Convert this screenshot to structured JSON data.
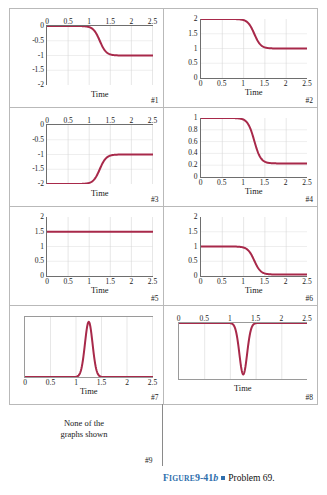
{
  "figure": {
    "caption_label": "FIGURE",
    "caption_number": "9-41",
    "caption_number_italic": "b",
    "caption_text": "Problem 69.",
    "accent_color": "#2f6fad",
    "curve_color": "#a8294a"
  },
  "axis": {
    "xlabel": "Time",
    "xticks": [
      "0",
      "0.5",
      "1",
      "1.5",
      "2",
      "2.5"
    ],
    "xlim": [
      0,
      2.5
    ]
  },
  "panels": [
    {
      "id": "#1",
      "xlabel": "Time",
      "xticks": [
        "0",
        "0.5",
        "1",
        "1.5",
        "2",
        "2.5"
      ],
      "xticks_position": "top",
      "yticks": [
        "0",
        "-0.5",
        "-1",
        "-1.5",
        "-2"
      ],
      "ylim": [
        -2,
        0
      ],
      "shape": "step-down",
      "start": 0,
      "end": -1,
      "center": 1.25
    },
    {
      "id": "#2",
      "xlabel": "Time",
      "xticks": [
        "0",
        "0.5",
        "1",
        "1.5",
        "2",
        "2.5"
      ],
      "xticks_position": "bottom",
      "yticks": [
        "2",
        "1.5",
        "1",
        "0.5",
        "0"
      ],
      "ylim": [
        0,
        2
      ],
      "shape": "step-down",
      "start": 2,
      "end": 1,
      "center": 1.25
    },
    {
      "id": "#3",
      "xlabel": "Time",
      "xticks": [
        "0",
        "0.5",
        "1",
        "1.5",
        "2",
        "2.5"
      ],
      "xticks_position": "top",
      "yticks": [
        "0",
        "-0.5",
        "-1",
        "-1.5",
        "-2"
      ],
      "ylim": [
        -2,
        0
      ],
      "shape": "step-up",
      "start": -2,
      "end": -1,
      "center": 1.25
    },
    {
      "id": "#4",
      "xlabel": "Time",
      "xticks": [
        "0",
        "0.5",
        "1",
        "1.5",
        "2",
        "2.5"
      ],
      "xticks_position": "bottom",
      "yticks": [
        "1",
        "0.8",
        "0.6",
        "0.4",
        "0.2",
        "0"
      ],
      "ylim": [
        0,
        1
      ],
      "shape": "step-down",
      "start": 1,
      "end": 0.23,
      "center": 1.25
    },
    {
      "id": "#5",
      "xlabel": "Time",
      "xticks": [
        "0",
        "0.5",
        "1",
        "1.5",
        "2",
        "2.5"
      ],
      "xticks_position": "bottom",
      "yticks": [
        "2",
        "1.5",
        "1",
        "0.5",
        "0"
      ],
      "ylim": [
        0,
        2
      ],
      "shape": "constant",
      "start": 1.5,
      "end": 1.5,
      "center": 1.25
    },
    {
      "id": "#6",
      "xlabel": "Time",
      "xticks": [
        "0",
        "0.5",
        "1",
        "1.5",
        "2",
        "2.5"
      ],
      "xticks_position": "bottom",
      "yticks": [
        "2",
        "1.5",
        "1",
        "0.5",
        "0"
      ],
      "ylim": [
        0,
        2
      ],
      "shape": "step-down",
      "start": 1,
      "end": 0.05,
      "center": 1.25
    },
    {
      "id": "#7",
      "xlabel": "Time",
      "xticks": [
        "0",
        "0.5",
        "1",
        "1.5",
        "2",
        "2.5"
      ],
      "xticks_position": "bottom",
      "yticks": [],
      "ylim": [
        0,
        1
      ],
      "shape": "peak-up",
      "start": 0,
      "end": 0,
      "center": 1.25
    },
    {
      "id": "#8",
      "xlabel": "Time",
      "xticks": [
        "0",
        "0.5",
        "1",
        "1.5",
        "2",
        "2.5"
      ],
      "xticks_position": "top",
      "yticks": [],
      "ylim": [
        -1,
        0
      ],
      "shape": "peak-down",
      "start": 0,
      "end": 0,
      "center": 1.25
    }
  ],
  "panel9": {
    "id": "#9",
    "line1": "None of the",
    "line2": "graphs shown"
  },
  "chart_data": [
    {
      "type": "line",
      "title": "#1",
      "xlabel": "Time",
      "ylabel": "",
      "xlim": [
        0,
        2.5
      ],
      "ylim": [
        -2,
        0
      ],
      "xticks": [
        0,
        0.5,
        1,
        1.5,
        2,
        2.5
      ],
      "yticks": [
        0,
        -0.5,
        -1,
        -1.5,
        -2
      ],
      "grid": true,
      "description": "Sigmoid step down from 0 to -1 centered near t = 1.25",
      "x": [
        0,
        0.25,
        0.5,
        0.75,
        1,
        1.1,
        1.2,
        1.25,
        1.3,
        1.4,
        1.5,
        1.75,
        2,
        2.25,
        2.5
      ],
      "values": [
        0,
        0,
        0,
        -0.01,
        -0.05,
        -0.13,
        -0.35,
        -0.5,
        -0.66,
        -0.88,
        -0.96,
        -1,
        -1,
        -1,
        -1
      ]
    },
    {
      "type": "line",
      "title": "#2",
      "xlabel": "Time",
      "ylabel": "",
      "xlim": [
        0,
        2.5
      ],
      "ylim": [
        0,
        2
      ],
      "xticks": [
        0,
        0.5,
        1,
        1.5,
        2,
        2.5
      ],
      "yticks": [
        0,
        0.5,
        1,
        1.5,
        2
      ],
      "grid": true,
      "description": "Sigmoid step down from 2 to 1 centered near t = 1.25",
      "x": [
        0,
        0.25,
        0.5,
        0.75,
        1,
        1.1,
        1.2,
        1.25,
        1.3,
        1.4,
        1.5,
        1.75,
        2,
        2.25,
        2.5
      ],
      "values": [
        2,
        2,
        2,
        1.99,
        1.95,
        1.87,
        1.65,
        1.5,
        1.34,
        1.12,
        1.04,
        1,
        1,
        1,
        1
      ]
    },
    {
      "type": "line",
      "title": "#3",
      "xlabel": "Time",
      "ylabel": "",
      "xlim": [
        0,
        2.5
      ],
      "ylim": [
        -2,
        0
      ],
      "xticks": [
        0,
        0.5,
        1,
        1.5,
        2,
        2.5
      ],
      "yticks": [
        0,
        -0.5,
        -1,
        -1.5,
        -2
      ],
      "grid": true,
      "description": "Sigmoid step up from -2 to -1 centered near t = 1.25",
      "x": [
        0,
        0.25,
        0.5,
        0.75,
        1,
        1.1,
        1.2,
        1.25,
        1.3,
        1.4,
        1.5,
        1.75,
        2,
        2.25,
        2.5
      ],
      "values": [
        -2,
        -2,
        -2,
        -1.99,
        -1.95,
        -1.87,
        -1.65,
        -1.5,
        -1.34,
        -1.12,
        -1.04,
        -1,
        -1,
        -1,
        -1
      ]
    },
    {
      "type": "line",
      "title": "#4",
      "xlabel": "Time",
      "ylabel": "",
      "xlim": [
        0,
        2.5
      ],
      "ylim": [
        0,
        1
      ],
      "xticks": [
        0,
        0.5,
        1,
        1.5,
        2,
        2.5
      ],
      "yticks": [
        0,
        0.2,
        0.4,
        0.6,
        0.8,
        1
      ],
      "grid": true,
      "description": "Sigmoid step down from 1 to about 0.23 centered near t = 1.25",
      "x": [
        0,
        0.25,
        0.5,
        0.75,
        1,
        1.1,
        1.2,
        1.25,
        1.3,
        1.4,
        1.5,
        1.75,
        2,
        2.25,
        2.5
      ],
      "values": [
        1,
        1,
        1,
        0.99,
        0.97,
        0.91,
        0.75,
        0.62,
        0.49,
        0.32,
        0.26,
        0.23,
        0.23,
        0.23,
        0.23
      ]
    },
    {
      "type": "line",
      "title": "#5",
      "xlabel": "Time",
      "ylabel": "",
      "xlim": [
        0,
        2.5
      ],
      "ylim": [
        0,
        2
      ],
      "xticks": [
        0,
        0.5,
        1,
        1.5,
        2,
        2.5
      ],
      "yticks": [
        0,
        0.5,
        1,
        1.5,
        2
      ],
      "grid": true,
      "description": "Constant horizontal line at 1.5",
      "x": [
        0,
        0.5,
        1,
        1.5,
        2,
        2.5
      ],
      "values": [
        1.5,
        1.5,
        1.5,
        1.5,
        1.5,
        1.5
      ]
    },
    {
      "type": "line",
      "title": "#6",
      "xlabel": "Time",
      "ylabel": "",
      "xlim": [
        0,
        2.5
      ],
      "ylim": [
        0,
        2
      ],
      "xticks": [
        0,
        0.5,
        1,
        1.5,
        2,
        2.5
      ],
      "yticks": [
        0,
        0.5,
        1,
        1.5,
        2
      ],
      "grid": true,
      "description": "Sigmoid step down from 1 to 0 centered near t = 1.25",
      "x": [
        0,
        0.25,
        0.5,
        0.75,
        1,
        1.1,
        1.2,
        1.25,
        1.3,
        1.4,
        1.5,
        1.75,
        2,
        2.25,
        2.5
      ],
      "values": [
        1,
        1,
        1,
        0.99,
        0.95,
        0.87,
        0.65,
        0.5,
        0.34,
        0.12,
        0.04,
        0.02,
        0.02,
        0.02,
        0.02
      ]
    },
    {
      "type": "line",
      "title": "#7",
      "xlabel": "Time",
      "ylabel": "",
      "xlim": [
        0,
        2.5
      ],
      "ylim": [
        0,
        1
      ],
      "xticks": [
        0,
        0.5,
        1,
        1.5,
        2,
        2.5
      ],
      "yticks": [],
      "grid": true,
      "description": "Narrow positive Gaussian pulse peaking at t = 1.25, baseline 0",
      "x": [
        0,
        0.5,
        1,
        1.05,
        1.1,
        1.15,
        1.2,
        1.25,
        1.3,
        1.35,
        1.4,
        1.45,
        1.5,
        2,
        2.5
      ],
      "values": [
        0,
        0,
        0.02,
        0.06,
        0.18,
        0.45,
        0.8,
        1,
        0.8,
        0.45,
        0.18,
        0.06,
        0.02,
        0,
        0
      ]
    },
    {
      "type": "line",
      "title": "#8",
      "xlabel": "Time",
      "ylabel": "",
      "xlim": [
        0,
        2.5
      ],
      "ylim": [
        -1,
        0
      ],
      "xticks": [
        0,
        0.5,
        1,
        1.5,
        2,
        2.5
      ],
      "yticks": [],
      "grid": true,
      "description": "Narrow negative Gaussian pulse dipping at t = 1.25, baseline 0",
      "x": [
        0,
        0.5,
        1,
        1.05,
        1.1,
        1.15,
        1.2,
        1.25,
        1.3,
        1.35,
        1.4,
        1.45,
        1.5,
        2,
        2.5
      ],
      "values": [
        0,
        0,
        -0.02,
        -0.06,
        -0.18,
        -0.45,
        -0.8,
        -1,
        -0.8,
        -0.45,
        -0.18,
        -0.06,
        -0.02,
        0,
        0
      ]
    }
  ]
}
